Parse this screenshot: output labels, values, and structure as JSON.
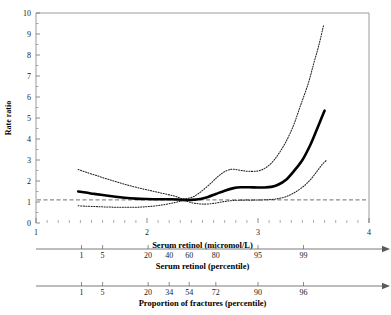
{
  "chart_data": {
    "type": "line",
    "title": "",
    "xlabel": "Serum retinol (micromol/L)",
    "ylabel": "Rate ratio",
    "xlim": [
      1,
      4
    ],
    "ylim": [
      0,
      10
    ],
    "grid": false,
    "legend": "none",
    "y_ticks": [
      "0",
      "1",
      "2",
      "3",
      "4",
      "5",
      "6",
      "7",
      "8",
      "9",
      "10"
    ],
    "x_ticks": [
      "1",
      "2",
      "3",
      "4"
    ],
    "reference_line": {
      "value": 1.1,
      "style": "dashed",
      "label": ""
    },
    "series": [
      {
        "name": "Rate ratio (fitted)",
        "style": "solid",
        "points": [
          [
            1.38,
            1.5
          ],
          [
            1.45,
            1.45
          ],
          [
            1.52,
            1.39
          ],
          [
            1.6,
            1.33
          ],
          [
            1.7,
            1.26
          ],
          [
            1.8,
            1.2
          ],
          [
            1.9,
            1.16
          ],
          [
            2.0,
            1.14
          ],
          [
            2.1,
            1.13
          ],
          [
            2.2,
            1.13
          ],
          [
            2.28,
            1.12
          ],
          [
            2.33,
            1.1
          ],
          [
            2.4,
            1.1
          ],
          [
            2.48,
            1.14
          ],
          [
            2.55,
            1.24
          ],
          [
            2.62,
            1.38
          ],
          [
            2.7,
            1.54
          ],
          [
            2.78,
            1.66
          ],
          [
            2.85,
            1.7
          ],
          [
            2.92,
            1.7
          ],
          [
            3.0,
            1.69
          ],
          [
            3.05,
            1.69
          ],
          [
            3.12,
            1.72
          ],
          [
            3.18,
            1.82
          ],
          [
            3.25,
            2.05
          ],
          [
            3.32,
            2.45
          ],
          [
            3.4,
            3.0
          ],
          [
            3.47,
            3.7
          ],
          [
            3.53,
            4.45
          ],
          [
            3.58,
            5.1
          ],
          [
            3.6,
            5.35
          ]
        ]
      },
      {
        "name": "Upper 95% confidence limit",
        "style": "dotted",
        "points": [
          [
            1.38,
            2.55
          ],
          [
            1.45,
            2.42
          ],
          [
            1.55,
            2.25
          ],
          [
            1.65,
            2.08
          ],
          [
            1.75,
            1.92
          ],
          [
            1.85,
            1.77
          ],
          [
            1.95,
            1.64
          ],
          [
            2.05,
            1.52
          ],
          [
            2.15,
            1.4
          ],
          [
            2.25,
            1.28
          ],
          [
            2.33,
            1.15
          ],
          [
            2.42,
            1.26
          ],
          [
            2.5,
            1.55
          ],
          [
            2.58,
            1.92
          ],
          [
            2.65,
            2.26
          ],
          [
            2.72,
            2.5
          ],
          [
            2.78,
            2.56
          ],
          [
            2.85,
            2.5
          ],
          [
            2.92,
            2.46
          ],
          [
            3.0,
            2.48
          ],
          [
            3.06,
            2.6
          ],
          [
            3.12,
            2.85
          ],
          [
            3.18,
            3.25
          ],
          [
            3.25,
            3.85
          ],
          [
            3.32,
            4.65
          ],
          [
            3.38,
            5.55
          ],
          [
            3.45,
            6.6
          ],
          [
            3.5,
            7.55
          ],
          [
            3.55,
            8.5
          ],
          [
            3.59,
            9.4
          ]
        ]
      },
      {
        "name": "Lower 95% confidence limit",
        "style": "dotted",
        "points": [
          [
            1.38,
            0.82
          ],
          [
            1.45,
            0.8
          ],
          [
            1.55,
            0.78
          ],
          [
            1.65,
            0.76
          ],
          [
            1.75,
            0.75
          ],
          [
            1.85,
            0.75
          ],
          [
            1.95,
            0.76
          ],
          [
            2.05,
            0.8
          ],
          [
            2.15,
            0.87
          ],
          [
            2.25,
            0.97
          ],
          [
            2.33,
            1.06
          ],
          [
            2.42,
            0.95
          ],
          [
            2.5,
            0.9
          ],
          [
            2.58,
            0.92
          ],
          [
            2.65,
            0.98
          ],
          [
            2.72,
            1.04
          ],
          [
            2.8,
            1.08
          ],
          [
            2.88,
            1.09
          ],
          [
            2.96,
            1.09
          ],
          [
            3.04,
            1.1
          ],
          [
            3.12,
            1.12
          ],
          [
            3.18,
            1.16
          ],
          [
            3.25,
            1.25
          ],
          [
            3.32,
            1.42
          ],
          [
            3.4,
            1.7
          ],
          [
            3.47,
            2.05
          ],
          [
            3.53,
            2.45
          ],
          [
            3.58,
            2.8
          ],
          [
            3.62,
            3.0
          ]
        ]
      }
    ],
    "secondary_axes": [
      {
        "label": "Serum retinol (percentile)",
        "ticks": [
          {
            "value": "1",
            "x": 1.41
          },
          {
            "value": "5",
            "x": 1.6
          },
          {
            "value": "20",
            "x": 2.01
          },
          {
            "value": "40",
            "x": 2.2
          },
          {
            "value": "60",
            "x": 2.38
          },
          {
            "value": "80",
            "x": 2.62
          },
          {
            "value": "95",
            "x": 3.0
          },
          {
            "value": "99",
            "x": 3.41
          }
        ]
      },
      {
        "label": "Proportion of fractures (percentile)",
        "ticks": [
          {
            "value": "1",
            "x": 1.41
          },
          {
            "value": "5",
            "x": 1.6
          },
          {
            "value": "20",
            "x": 2.01
          },
          {
            "value": "34",
            "x": 2.2
          },
          {
            "value": "54",
            "x": 2.38
          },
          {
            "value": "72",
            "x": 2.62
          },
          {
            "value": "90",
            "x": 3.0
          },
          {
            "value": "96",
            "x": 3.41
          }
        ]
      }
    ]
  }
}
